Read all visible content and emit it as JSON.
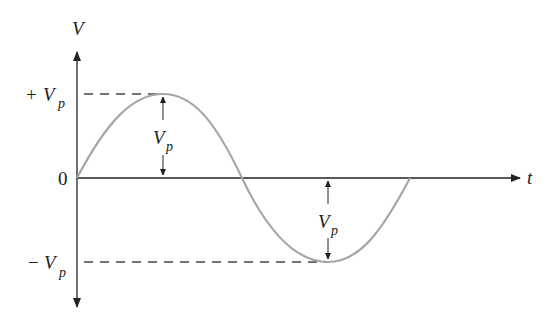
{
  "diagram": {
    "axes": {
      "y_label": "V",
      "x_label": "t"
    },
    "ticks": {
      "positive_peak": {
        "sign": "+",
        "symbol": "V",
        "subscript": "p"
      },
      "zero": "0",
      "negative_peak": {
        "sign": "−",
        "symbol": "V",
        "subscript": "p"
      }
    },
    "annotations": [
      {
        "name": "positive-peak-amplitude",
        "symbol": "V",
        "subscript": "p"
      },
      {
        "name": "negative-peak-amplitude",
        "symbol": "V",
        "subscript": "p"
      }
    ],
    "colors": {
      "axis": "#222222",
      "waveform": "#a6a6a6",
      "dashed_guide": "#444444"
    }
  }
}
